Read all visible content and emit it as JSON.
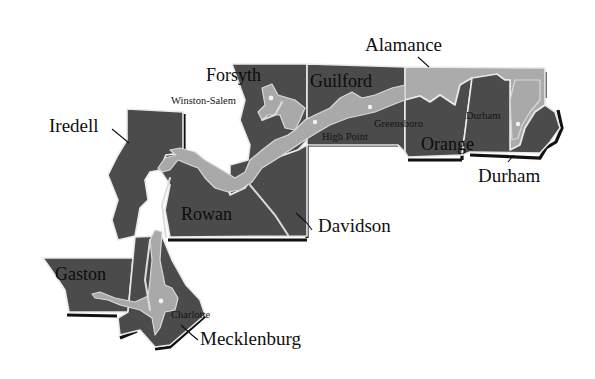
{
  "map": {
    "title": "",
    "colors": {
      "county_fill": "#4b4b4b",
      "urban_fill": "#a9a9a9",
      "alamance_fill": "#ababab",
      "border": "#e9e9e9",
      "shadow": "#111111",
      "label": "#141414"
    },
    "counties": [
      {
        "id": "iredell",
        "label": "Iredell"
      },
      {
        "id": "forsyth",
        "label": "Forsyth"
      },
      {
        "id": "guilford",
        "label": "Guilford"
      },
      {
        "id": "alamance",
        "label": "Alamance"
      },
      {
        "id": "orange",
        "label": "Orange"
      },
      {
        "id": "durham",
        "label": "Durham"
      },
      {
        "id": "rowan",
        "label": "Rowan"
      },
      {
        "id": "davidson",
        "label": "Davidson"
      },
      {
        "id": "gaston",
        "label": "Gaston"
      },
      {
        "id": "mecklenburg",
        "label": "Mecklenburg"
      }
    ],
    "cities": [
      {
        "id": "winston-salem",
        "label": "Winston-Salem"
      },
      {
        "id": "high-point",
        "label": "High Point"
      },
      {
        "id": "greensboro",
        "label": "Greensboro"
      },
      {
        "id": "durham-city",
        "label": "Durham"
      },
      {
        "id": "charlotte",
        "label": "Charlotte"
      }
    ]
  }
}
